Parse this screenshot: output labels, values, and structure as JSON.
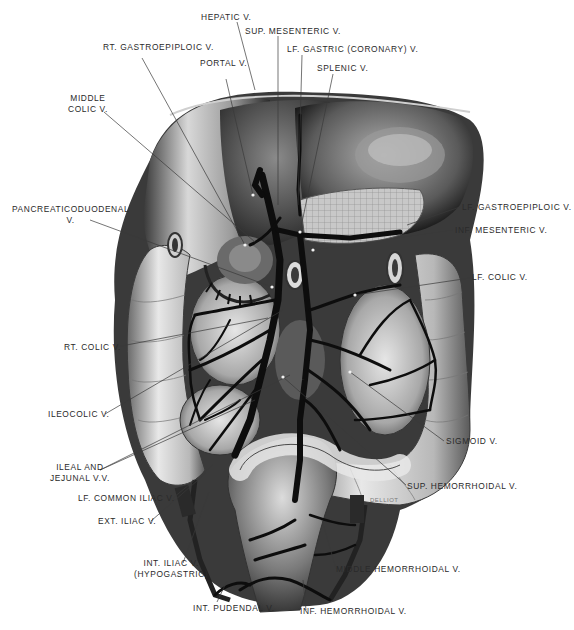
{
  "figure": {
    "signature": "DELLIOT"
  },
  "labels": {
    "hepatic_v": "HEPATIC V.",
    "sup_mesenteric_v": "SUP. MESENTERIC V.",
    "rt_gastroepiploic_v": "RT. GASTROEPIPLOIC V.",
    "lf_gastric_coronary_v": "LF. GASTRIC (CORONARY) V.",
    "portal_v": "PORTAL V.",
    "splenic_v": "SPLENIC V.",
    "middle_colic_v_line1": "MIDDLE",
    "middle_colic_v_line2": "COLIC V.",
    "pancreaticoduodenal_v_line1": "PANCREATICODUODENAL",
    "pancreaticoduodenal_v_line2": "V.",
    "lf_gastroepiploic_v": "LF. GASTROEPIPLOIC V.",
    "inf_mesenteric_v": "INF. MESENTERIC V.",
    "lf_colic_v": "LF. COLIC V.",
    "rt_colic_v": "RT. COLIC V.",
    "ileocolic_v": "ILEOCOLIC V.",
    "ileal_jejunal_vv_line1": "ILEAL AND",
    "ileal_jejunal_vv_line2": "JEJUNAL V.V.",
    "sigmoid_v": "SIGMOID V.",
    "lf_common_iliac_v": "LF. COMMON ILIAC V.",
    "sup_hemorrhoidal_v": "SUP. HEMORRHOIDAL V.",
    "ext_iliac_v": "EXT. ILIAC V.",
    "int_iliac_v_line1": "INT. ILIAC V.",
    "int_iliac_v_line2": "(HYPOGASTRIC)",
    "middle_hemorrhoidal_v": "MIDDLE HEMORRHOIDAL V.",
    "int_pudendal_v": "INT. PUDENDAL V.",
    "inf_hemorrhoidal_v": "INF. HEMORRHOIDAL V."
  }
}
